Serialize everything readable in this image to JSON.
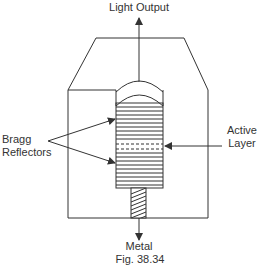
{
  "diagram": {
    "type": "VCSEL cross-section",
    "labels": {
      "light_output": "Light Output",
      "bragg_line1": "Bragg",
      "bragg_line2": "Reflectors",
      "active_line1": "Active",
      "active_line2": "Layer",
      "metal": "Metal",
      "caption": "Fig. 38.34"
    },
    "colors": {
      "stroke": "#333333",
      "background": "#ffffff"
    }
  }
}
